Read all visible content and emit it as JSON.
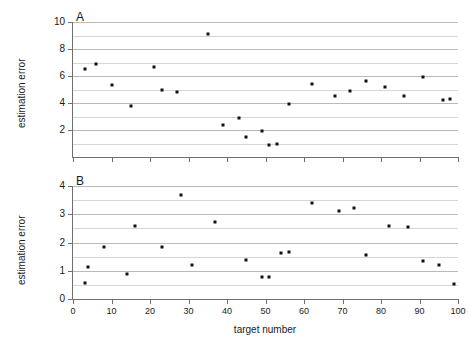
{
  "figure": {
    "panel_a_letter": "A",
    "panel_b_letter": "B",
    "xlabel": "target number",
    "ylabel_a": "estimation error",
    "ylabel_b": "estimation error"
  },
  "chart_data": [
    {
      "type": "scatter",
      "panel": "A",
      "title": "A",
      "xlabel": "",
      "ylabel": "estimation error",
      "xlim": [
        0,
        100
      ],
      "ylim": [
        0,
        10
      ],
      "xticks": [
        0,
        10,
        20,
        30,
        40,
        50,
        60,
        70,
        80,
        90,
        100
      ],
      "xticklabels": [
        "",
        "",
        "",
        "",
        "",
        "",
        "",
        "",
        "",
        "",
        ""
      ],
      "yticks": [
        2,
        4,
        6,
        8,
        10
      ],
      "yticklabels": [
        "2",
        "4",
        "6",
        "8",
        "10"
      ],
      "minor_gridlines_y": [
        1,
        3,
        5,
        7,
        9
      ],
      "grid": true,
      "legend": "none",
      "marker": "square",
      "marker_color": "#111111",
      "points": [
        {
          "x": 3,
          "y": 6.5
        },
        {
          "x": 6,
          "y": 6.9
        },
        {
          "x": 10,
          "y": 5.3
        },
        {
          "x": 15,
          "y": 3.8
        },
        {
          "x": 21,
          "y": 6.7
        },
        {
          "x": 23,
          "y": 5.0
        },
        {
          "x": 27,
          "y": 4.8
        },
        {
          "x": 35,
          "y": 9.1
        },
        {
          "x": 39,
          "y": 2.4
        },
        {
          "x": 43,
          "y": 2.9
        },
        {
          "x": 45,
          "y": 1.5
        },
        {
          "x": 49,
          "y": 1.9
        },
        {
          "x": 51,
          "y": 0.9
        },
        {
          "x": 53,
          "y": 1.0
        },
        {
          "x": 56,
          "y": 3.9
        },
        {
          "x": 62,
          "y": 5.4
        },
        {
          "x": 68,
          "y": 4.5
        },
        {
          "x": 72,
          "y": 4.9
        },
        {
          "x": 76,
          "y": 5.6
        },
        {
          "x": 81,
          "y": 5.2
        },
        {
          "x": 86,
          "y": 4.5
        },
        {
          "x": 91,
          "y": 5.9
        },
        {
          "x": 96,
          "y": 4.2
        },
        {
          "x": 98,
          "y": 4.3
        }
      ]
    },
    {
      "type": "scatter",
      "panel": "B",
      "title": "B",
      "xlabel": "target number",
      "ylabel": "estimation error",
      "xlim": [
        0,
        100
      ],
      "ylim": [
        0,
        4
      ],
      "xticks": [
        0,
        10,
        20,
        30,
        40,
        50,
        60,
        70,
        80,
        90,
        100
      ],
      "xticklabels": [
        "0",
        "10",
        "20",
        "30",
        "40",
        "50",
        "60",
        "70",
        "80",
        "90",
        "100"
      ],
      "yticks": [
        0,
        1,
        2,
        3,
        4
      ],
      "yticklabels": [
        "0",
        "1",
        "2",
        "3",
        "4"
      ],
      "minor_gridlines_y": [
        0.5,
        1.5,
        2.5,
        3.5
      ],
      "grid": true,
      "legend": "none",
      "marker": "square",
      "marker_color": "#111111",
      "points": [
        {
          "x": 3,
          "y": 0.55
        },
        {
          "x": 4,
          "y": 1.12
        },
        {
          "x": 8,
          "y": 1.85
        },
        {
          "x": 14,
          "y": 0.88
        },
        {
          "x": 16,
          "y": 2.58
        },
        {
          "x": 23,
          "y": 1.85
        },
        {
          "x": 28,
          "y": 3.68
        },
        {
          "x": 31,
          "y": 1.2
        },
        {
          "x": 37,
          "y": 2.72
        },
        {
          "x": 45,
          "y": 1.38
        },
        {
          "x": 49,
          "y": 0.78
        },
        {
          "x": 51,
          "y": 0.78
        },
        {
          "x": 54,
          "y": 1.62
        },
        {
          "x": 56,
          "y": 1.68
        },
        {
          "x": 62,
          "y": 3.4
        },
        {
          "x": 69,
          "y": 3.1
        },
        {
          "x": 73,
          "y": 3.22
        },
        {
          "x": 76,
          "y": 1.55
        },
        {
          "x": 82,
          "y": 2.6
        },
        {
          "x": 87,
          "y": 2.55
        },
        {
          "x": 91,
          "y": 1.35
        },
        {
          "x": 95,
          "y": 1.22
        },
        {
          "x": 99,
          "y": 0.52
        }
      ]
    }
  ]
}
